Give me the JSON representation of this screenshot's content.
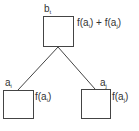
{
  "diagram": {
    "parent": {
      "name": "b",
      "sub": "t",
      "value_label": "f(a_i) + f(a_j)"
    },
    "children": [
      {
        "name": "a",
        "sub": "i",
        "value_label": "f(a_i)"
      },
      {
        "name": "a",
        "sub": "j",
        "value_label": "f(a_j)"
      }
    ],
    "colors": {
      "stroke": "#444444",
      "text": "#333333"
    }
  }
}
